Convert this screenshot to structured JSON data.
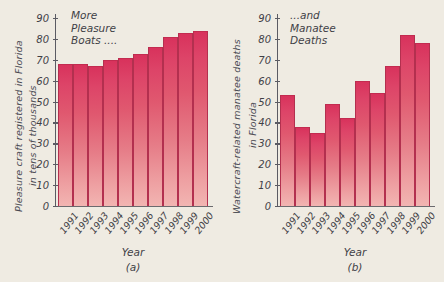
{
  "figure": {
    "background_color": "#efebe2",
    "bar_color_top": "#d8325c",
    "bar_color_bottom": "#f2b5b2",
    "axis_color": "#5b5b63"
  },
  "panels": [
    {
      "key": "a",
      "panel_label": "(a)",
      "annotation": "More\nPleasure\nBoats ....",
      "ylabel_line1": "Pleasure craft registered in Florida",
      "ylabel_line2": "in tens of thousands",
      "xlabel": "Year"
    },
    {
      "key": "b",
      "panel_label": "(b)",
      "annotation": "...and\nManatee\nDeaths",
      "ylabel_line1": "Watercraft-related manatee deaths",
      "ylabel_line2": "in Florida",
      "xlabel": "Year"
    }
  ],
  "yticks": [
    "90",
    "80",
    "70",
    "60",
    "50",
    "40",
    "30",
    "20",
    "10",
    "0"
  ],
  "chart_data": [
    {
      "type": "bar",
      "title": "More Pleasure Boats ....",
      "panel": "(a)",
      "xlabel": "Year",
      "ylabel": "Pleasure craft registered in Florida in tens of thousands",
      "categories": [
        "1991",
        "1992",
        "1993",
        "1994",
        "1995",
        "1996",
        "1997",
        "1998",
        "1999",
        "2000"
      ],
      "values": [
        68,
        68,
        67,
        70,
        71,
        73,
        76,
        81,
        83,
        84
      ],
      "ylim": [
        0,
        90
      ],
      "ytick_step": 10,
      "grid": false,
      "legend": "none"
    },
    {
      "type": "bar",
      "title": "...and Manatee Deaths",
      "panel": "(b)",
      "xlabel": "Year",
      "ylabel": "Watercraft-related manatee deaths in Florida",
      "categories": [
        "1991",
        "1992",
        "1993",
        "1994",
        "1995",
        "1996",
        "1997",
        "1998",
        "1999",
        "2000"
      ],
      "values": [
        53,
        38,
        35,
        49,
        42,
        60,
        54,
        67,
        82,
        78
      ],
      "ylim": [
        0,
        90
      ],
      "ytick_step": 10,
      "grid": false,
      "legend": "none"
    }
  ]
}
